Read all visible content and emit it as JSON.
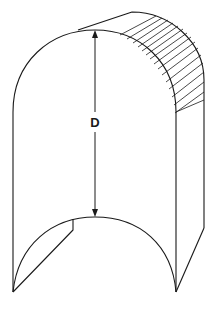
{
  "diagram": {
    "title": "",
    "dimension_label": "D",
    "colors": {
      "line": "#1a1a1a",
      "background": "#ffffff"
    }
  }
}
